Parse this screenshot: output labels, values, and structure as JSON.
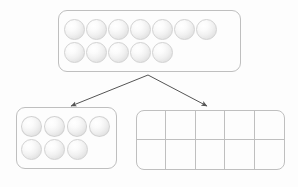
{
  "diagram": {
    "title": "Decomposing 12 counters into a group of 7 and an empty ten-frame",
    "background_color": "#fdfdfd",
    "outline_color": "#bfbfbf",
    "counter_color": "#e8e8e8",
    "arrow_color": "#555555"
  },
  "top_group": {
    "label": "Whole group of counters",
    "total": 12,
    "rows": [
      {
        "count": 7
      },
      {
        "count": 5
      }
    ]
  },
  "left_group": {
    "label": "Part group of counters",
    "total": 7,
    "rows": [
      {
        "count": 4
      },
      {
        "count": 3
      }
    ]
  },
  "ten_frame": {
    "label": "Empty ten-frame",
    "columns": 5,
    "rows": 2,
    "cells": 10,
    "filled": 0
  },
  "arrows": [
    {
      "name": "arrow-to-left-group",
      "from_x": 148,
      "from_y": 75,
      "to_x": 69,
      "to_y": 108
    },
    {
      "name": "arrow-to-ten-frame",
      "from_x": 148,
      "from_y": 75,
      "to_x": 209,
      "to_y": 108
    }
  ]
}
